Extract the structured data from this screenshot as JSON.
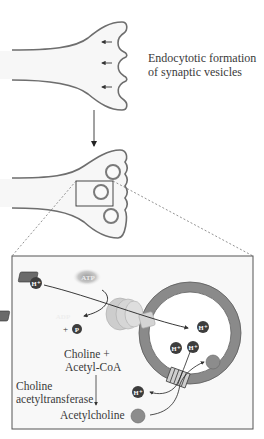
{
  "figure": {
    "type": "diagram"
  },
  "labels": {
    "endocytosis_line1": "Endocytotic formation",
    "endocytosis_line2": "of synaptic vesicles",
    "substrates_line1": "Choline +",
    "substrates_line2": "Acetyl-CoA",
    "enzyme_line1": "Choline",
    "enzyme_line2": "acetyltransferase",
    "product": "Acetylcholine"
  },
  "molecules": {
    "atp": "ATP",
    "adp": "ADP",
    "plus": "+",
    "phosphate": "P",
    "proton": "H⁺"
  },
  "colors": {
    "membrane_outline": "#6e6e6e",
    "terminal_fill": "#f7f7f7",
    "vesicle_membrane": "#8a8a8a",
    "vesicle_inner_edge": "#5a5a5a",
    "proton_fill": "#3d3d3d",
    "acetylcholine_fill": "#8c8c8c",
    "atpase_fill": "#cfcfcf",
    "detail_box_bg": "#f8f8f8",
    "dashed_line": "#777777"
  }
}
